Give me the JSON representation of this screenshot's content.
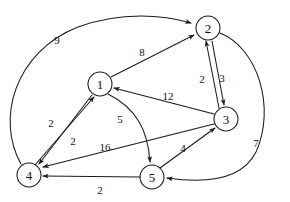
{
  "diagram": {
    "type": "directed-weighted-graph",
    "stroke_color": "#1a1a1a",
    "background_color": "#ffffff",
    "node_radius": 12,
    "nodes": [
      {
        "id": "1",
        "label": "1",
        "cx": 100,
        "cy": 84
      },
      {
        "id": "2",
        "label": "2",
        "cx": 208,
        "cy": 28
      },
      {
        "id": "3",
        "label": "3",
        "cx": 226,
        "cy": 119
      },
      {
        "id": "4",
        "label": "4",
        "cx": 29,
        "cy": 175
      },
      {
        "id": "5",
        "label": "5",
        "cx": 152,
        "cy": 177
      }
    ],
    "edges": [
      {
        "id": "edge-4-2",
        "from": "4",
        "to": "2",
        "weight": "9",
        "label_x": 57,
        "label_y": 40,
        "path": "M 21 164 C -4 120 14 52 78 27 C 122 11 164 15 191 23",
        "directed": true
      },
      {
        "id": "edge-1-2",
        "from": "1",
        "to": "2",
        "weight": "8",
        "label_x": 142,
        "label_y": 52,
        "path": "M 111 77 L 194 35",
        "directed": true
      },
      {
        "id": "edge-3-2",
        "from": "3",
        "to": "2",
        "weight": "2",
        "label_x": 202,
        "label_y": 79,
        "path": "M 219 108 L 206 41",
        "directed": true
      },
      {
        "id": "edge-2-3",
        "from": "2",
        "to": "3",
        "weight": "3",
        "label_x": 222,
        "label_y": 78,
        "path": "M 212 41 L 224 105",
        "directed": true
      },
      {
        "id": "edge-3-1",
        "from": "3",
        "to": "1",
        "weight": "12",
        "label_x": 168,
        "label_y": 96,
        "path": "M 214 114 L 114 88",
        "directed": true
      },
      {
        "id": "edge-1-4",
        "from": "1",
        "to": "4",
        "weight": "2",
        "label_x": 51,
        "label_y": 123,
        "path": "M 92 95 L 39 164",
        "directed": true
      },
      {
        "id": "edge-4-1",
        "from": "4",
        "to": "1",
        "weight": "2",
        "label_x": 73,
        "label_y": 141,
        "path": "M 35 165 L 94 97",
        "directed": true
      },
      {
        "id": "edge-1-5",
        "from": "1",
        "to": "5",
        "weight": "5",
        "label_x": 120,
        "label_y": 119,
        "path": "M 108 94 C 136 108 148 130 150 162",
        "directed": true
      },
      {
        "id": "edge-3-4",
        "from": "3",
        "to": "4",
        "weight": "16",
        "label_x": 105,
        "label_y": 147,
        "path": "M 214 124 L 43 167",
        "directed": true
      },
      {
        "id": "edge-5-3",
        "from": "5",
        "to": "3",
        "weight": "4",
        "label_x": 183,
        "label_y": 148,
        "path": "M 160 168 L 215 128",
        "directed": true
      },
      {
        "id": "edge-5-4",
        "from": "5",
        "to": "4",
        "weight": "2",
        "label_x": 100,
        "label_y": 190,
        "path": "M 140 177 L 43 176",
        "directed": true
      },
      {
        "id": "edge-2-5",
        "from": "2",
        "to": "5",
        "weight": "7",
        "label_x": 256,
        "label_y": 143,
        "path": "M 220 33 C 258 48 276 108 256 152 C 243 178 209 184 167 178",
        "directed": true
      }
    ]
  }
}
